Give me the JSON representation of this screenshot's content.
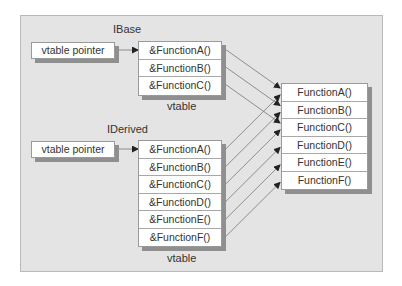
{
  "base": {
    "title": "IBase",
    "pointer_label": "vtable pointer",
    "vtable_label": "vtable",
    "entries": [
      "&FunctionA()",
      "&FunctionB()",
      "&FunctionC()"
    ]
  },
  "derived": {
    "title": "IDerived",
    "pointer_label": "vtable pointer",
    "vtable_label": "vtable",
    "entries": [
      "&FunctionA()",
      "&FunctionB()",
      "&FunctionC()",
      "&FunctionD()",
      "&FunctionE()",
      "&FunctionF()"
    ]
  },
  "functions": [
    "FunctionA()",
    "FunctionB()",
    "FunctionC()",
    "FunctionD()",
    "FunctionE()",
    "FunctionF()"
  ],
  "colors": {
    "background": "#e4e4e4",
    "line": "#777777",
    "shadow": "#8f8f8f"
  }
}
